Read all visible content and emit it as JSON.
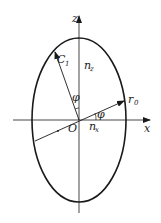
{
  "diagram": {
    "axes": {
      "x_label": "x",
      "z_label": "z"
    },
    "origin_label": "O",
    "labels": {
      "c1": "C",
      "c1_sub": "1",
      "r0": "r",
      "r0_sub": "0",
      "nz": "n",
      "nz_sub": "z",
      "nx": "n",
      "nx_sub": "x",
      "phi_upper": "φ",
      "phi_lower": "φ"
    },
    "colors": {
      "stroke": "#1a1a1a",
      "background": "#ffffff"
    }
  }
}
